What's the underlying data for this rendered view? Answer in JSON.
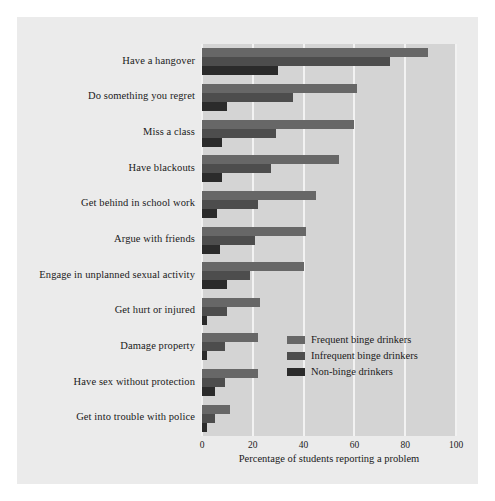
{
  "chart_data": {
    "type": "bar",
    "orientation": "horizontal",
    "title": "",
    "xlabel": "Percentage of students reporting a problem",
    "ylabel": "",
    "xlim": [
      0,
      100
    ],
    "xticks": [
      0,
      20,
      40,
      60,
      80,
      100
    ],
    "grid": true,
    "legend_position": "lower right",
    "categories": [
      "Have a hangover",
      "Do something you regret",
      "Miss a class",
      "Have blackouts",
      "Get behind in school work",
      "Argue with friends",
      "Engage in unplanned sexual activity",
      "Get hurt or injured",
      "Damage property",
      "Have sex without protection",
      "Get into trouble with police"
    ],
    "series": [
      {
        "name": "Frequent binge drinkers",
        "color": "#676767",
        "values": [
          89,
          61,
          60,
          54,
          45,
          41,
          40,
          23,
          22,
          22,
          11
        ]
      },
      {
        "name": "Infrequent binge drinkers",
        "color": "#4d4d4d",
        "values": [
          74,
          36,
          29,
          27,
          22,
          21,
          19,
          10,
          9,
          9,
          5
        ]
      },
      {
        "name": "Non-binge drinkers",
        "color": "#2b2b2b",
        "values": [
          30,
          10,
          8,
          8,
          6,
          7,
          10,
          2,
          2,
          5,
          2
        ]
      }
    ],
    "colors": {
      "figure_background": "#ebebeb",
      "plot_background": "#d4d4d4",
      "gridline": "#f2f2f2",
      "text": "#1a1a1a"
    }
  }
}
